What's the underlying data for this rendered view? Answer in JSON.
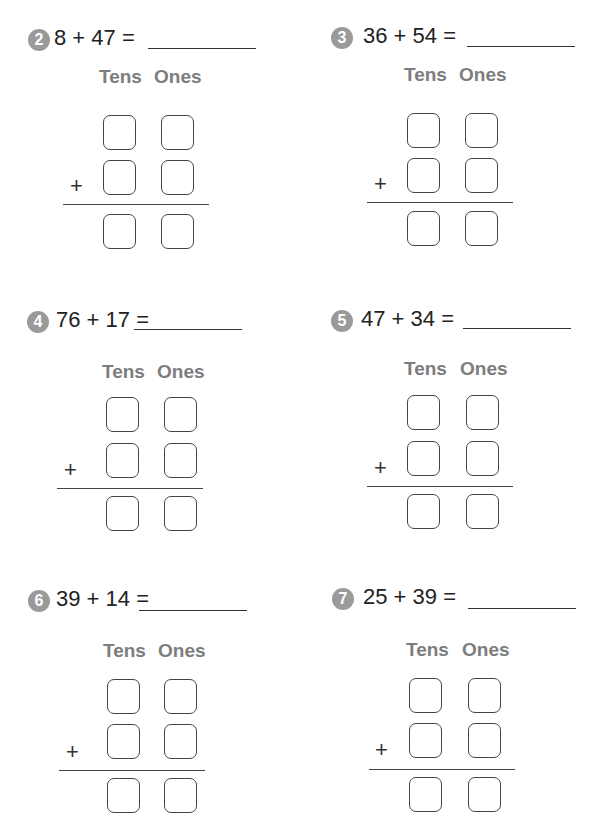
{
  "worksheet": {
    "column_headers": {
      "tens": "Tens",
      "ones": "Ones"
    },
    "plus_sign": "+",
    "problems": [
      {
        "number": "2",
        "equation": "8 + 47 =",
        "addend1": 8,
        "addend2": 47,
        "answer": ""
      },
      {
        "number": "3",
        "equation": "36 + 54 =",
        "addend1": 36,
        "addend2": 54,
        "answer": ""
      },
      {
        "number": "4",
        "equation": "76 + 17 =",
        "addend1": 76,
        "addend2": 17,
        "answer": ""
      },
      {
        "number": "5",
        "equation": "47 + 34 =",
        "addend1": 47,
        "addend2": 34,
        "answer": ""
      },
      {
        "number": "6",
        "equation": "39 + 14 =",
        "addend1": 39,
        "addend2": 14,
        "answer": ""
      },
      {
        "number": "7",
        "equation": "25 + 39 =",
        "addend1": 25,
        "addend2": 39,
        "answer": ""
      }
    ]
  },
  "colors": {
    "badge": "#9a9a9a",
    "header_text": "#7d7d7d",
    "equation_text": "#222222",
    "box_border": "#444444"
  }
}
